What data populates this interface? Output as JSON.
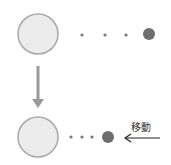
{
  "diagram": {
    "label": "移動",
    "colors": {
      "large_circle_fill": "#ececec",
      "large_circle_stroke": "#a8a8a8",
      "small_dot": "#777777",
      "target_dot": "#6e6e6e",
      "down_arrow": "#9a9a9a",
      "move_arrow": "#222222"
    },
    "top_row": {
      "large_circle": {
        "cx": 38,
        "cy": 34,
        "r": 20
      },
      "dots": [
        {
          "cx": 82,
          "cy": 35
        },
        {
          "cx": 105,
          "cy": 35
        },
        {
          "cx": 126,
          "cy": 35
        }
      ],
      "target": {
        "cx": 149,
        "cy": 34,
        "r": 6
      }
    },
    "bottom_row": {
      "large_circle": {
        "cx": 38,
        "cy": 137,
        "r": 20
      },
      "dots": [
        {
          "cx": 71,
          "cy": 137
        },
        {
          "cx": 82,
          "cy": 137
        },
        {
          "cx": 92,
          "cy": 137
        }
      ],
      "target": {
        "cx": 108,
        "cy": 137,
        "r": 6
      }
    }
  }
}
